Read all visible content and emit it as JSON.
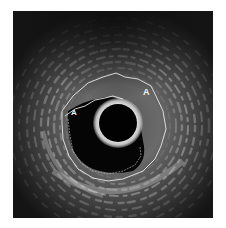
{
  "image": {
    "type": "intravascular-ultrasound",
    "frame": {
      "x": 13,
      "y": 11,
      "width": 200,
      "height": 207
    },
    "catheter": {
      "cx": 105,
      "cy": 112,
      "r": 19
    },
    "labels": [
      {
        "text": "A",
        "x": 130,
        "y": 77
      },
      {
        "text": "A",
        "x": 58,
        "y": 97
      }
    ],
    "colors": {
      "background": "#ffffff",
      "frame": "#141414",
      "contour": "#e8e8e8",
      "catheter_ring": "#d9d9d9"
    }
  }
}
